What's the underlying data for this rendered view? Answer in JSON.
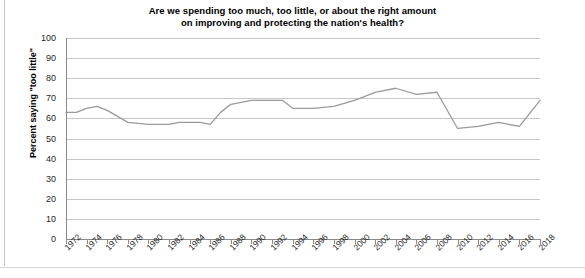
{
  "chart_data": {
    "type": "line",
    "title": "Are we spending too much, too little, or about the right amount on improving and protecting the nation's health?",
    "title_line1": "Are we spending too much, too little, or about the right amount",
    "title_line2": "on improving and protecting the nation's health?",
    "xlabel": "",
    "ylabel": "Percent saying \"too little\"",
    "ylim": [
      0,
      100
    ],
    "ytick_values": [
      100,
      90,
      80,
      70,
      60,
      50,
      40,
      30,
      20,
      10,
      0
    ],
    "ytick_labels": [
      "100",
      "90",
      "80",
      "70",
      "60",
      "50",
      "40",
      "30",
      "20",
      "10",
      "0"
    ],
    "xlim": [
      1972,
      2018
    ],
    "xtick_labels": [
      "1972",
      "1974",
      "1976",
      "1978",
      "1980",
      "1982",
      "1984",
      "1986",
      "1988",
      "1990",
      "1992",
      "1994",
      "1996",
      "1998",
      "2000",
      "2002",
      "2004",
      "2006",
      "2008",
      "2010",
      "2012",
      "2014",
      "2016",
      "2018"
    ],
    "grid": "horizontal",
    "legend": "none",
    "line_color": "#9a9a9a",
    "series": [
      {
        "name": "Percent saying \"too little\"",
        "x": [
          1972,
          1973,
          1974,
          1975,
          1976,
          1977,
          1978,
          1980,
          1982,
          1983,
          1984,
          1985,
          1986,
          1987,
          1988,
          1989,
          1990,
          1991,
          1993,
          1994,
          1996,
          1998,
          2000,
          2002,
          2004,
          2006,
          2008,
          2010,
          2012,
          2014,
          2016,
          2018
        ],
        "values": [
          63,
          63,
          65,
          66,
          64,
          61,
          58,
          57,
          57,
          58,
          58,
          58,
          57,
          63,
          67,
          68,
          69,
          69,
          69,
          65,
          65,
          66,
          69,
          73,
          75,
          72,
          73,
          55,
          56,
          58,
          56,
          69
        ]
      }
    ]
  }
}
